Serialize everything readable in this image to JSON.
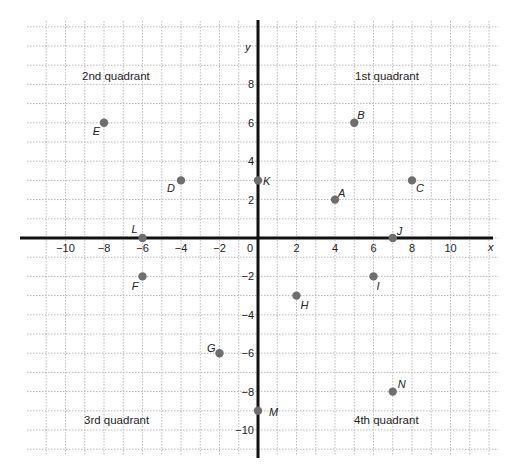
{
  "chart_data": {
    "type": "scatter",
    "title": "",
    "xlabel": "x",
    "ylabel": "y",
    "xlim": [
      -12,
      12
    ],
    "ylim": [
      -11,
      11
    ],
    "grid": true,
    "x_ticks": [
      -10,
      -8,
      -6,
      -4,
      -2,
      0,
      2,
      4,
      6,
      8,
      10
    ],
    "y_ticks": [
      -10,
      -8,
      -6,
      -4,
      -2,
      2,
      4,
      6,
      8
    ],
    "x_tick_labels": [
      "−10",
      "−8",
      "−6",
      "−4",
      "−2",
      "0",
      "2",
      "4",
      "6",
      "8",
      "10"
    ],
    "y_tick_labels": [
      "−10",
      "−8",
      "−6",
      "−4",
      "−2",
      "2",
      "4",
      "6",
      "8"
    ],
    "quadrant_labels": {
      "q1": "1st quadrant",
      "q2": "2nd quadrant",
      "q3": "3rd quadrant",
      "q4": "4th quadrant"
    },
    "points": [
      {
        "label": "A",
        "x": 4,
        "y": 2
      },
      {
        "label": "B",
        "x": 5,
        "y": 6
      },
      {
        "label": "C",
        "x": 8,
        "y": 3
      },
      {
        "label": "D",
        "x": -4,
        "y": 3
      },
      {
        "label": "E",
        "x": -8,
        "y": 6
      },
      {
        "label": "F",
        "x": -6,
        "y": -2
      },
      {
        "label": "G",
        "x": -2,
        "y": -6
      },
      {
        "label": "H",
        "x": 2,
        "y": -3
      },
      {
        "label": "I",
        "x": 6,
        "y": -2
      },
      {
        "label": "J",
        "x": 7,
        "y": 0
      },
      {
        "label": "K",
        "x": 0,
        "y": 3
      },
      {
        "label": "L",
        "x": -6,
        "y": 0
      },
      {
        "label": "M",
        "x": 0,
        "y": -9
      },
      {
        "label": "N",
        "x": 7,
        "y": -8
      }
    ]
  },
  "colors": {
    "point": "#6e6e6e",
    "axis": "#111111",
    "grid": "#b9b9b9"
  }
}
